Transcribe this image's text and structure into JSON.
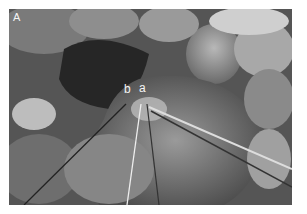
{
  "figure": {
    "panel_label": "A",
    "annotations": [
      {
        "id": "b",
        "label": "b"
      },
      {
        "id": "a",
        "label": "a"
      }
    ],
    "colors": {
      "background": "#ffffff",
      "label": "#f4f4f4"
    }
  }
}
